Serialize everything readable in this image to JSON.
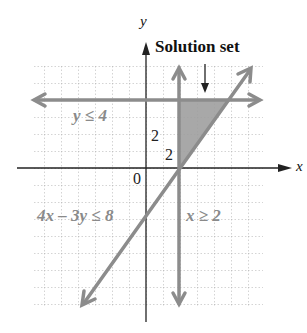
{
  "figure": {
    "title": "Solution set",
    "axes": {
      "x_label": "x",
      "y_label": "y",
      "origin_label": "0"
    },
    "ticks": {
      "y_tick_label": "2",
      "x_tick_label": "2"
    },
    "inequalities": {
      "horizontal": "y ≤ 4",
      "diagonal": "4x – 3y ≤ 8",
      "vertical": "x ≥ 2"
    },
    "colors": {
      "boundary_lines": "#8c8c8c",
      "shaded_region": "#9e9e9e",
      "axes": "#222222",
      "grid": "#aaaaaa"
    },
    "solution_region_vertices": [
      [
        2,
        0
      ],
      [
        2,
        4
      ],
      [
        5,
        4
      ]
    ]
  }
}
